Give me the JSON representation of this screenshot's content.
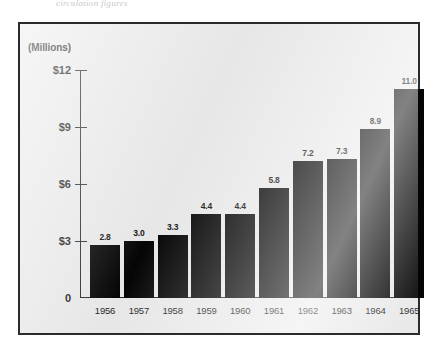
{
  "caption_fragment": "circulation figures",
  "axis_unit_label": "(Millions)",
  "chart_data": {
    "type": "bar",
    "title": "",
    "xlabel": "",
    "ylabel": "(Millions)",
    "categories": [
      "1956",
      "1957",
      "1958",
      "1959",
      "1960",
      "1961",
      "1962",
      "1963",
      "1964",
      "1965"
    ],
    "values": [
      2.8,
      3.0,
      3.3,
      4.4,
      4.4,
      5.8,
      7.2,
      7.3,
      8.9,
      11.0
    ],
    "value_labels": [
      "2.8",
      "3.0",
      "3.3",
      "4.4",
      "4.4",
      "5.8",
      "7.2",
      "7.3",
      "8.9",
      "11.0"
    ],
    "ylim": [
      0,
      12
    ],
    "yticks": [
      0,
      3,
      6,
      9,
      12
    ],
    "ytick_labels": [
      "0",
      "$3",
      "$6",
      "$9",
      "$12"
    ],
    "grid": false,
    "legend": false,
    "bar_color": "#050505",
    "plot_background": "#ebebeb",
    "frame_color": "#2b2b2b"
  }
}
